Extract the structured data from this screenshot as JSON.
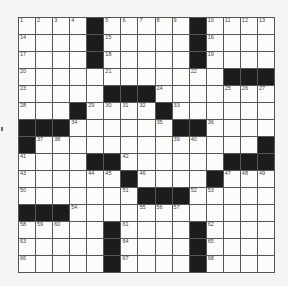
{
  "puzzle": {
    "size": 15,
    "rows": [
      ".... ..... ....",
      ".... ..... ....",
      ".... ..... ....",
      "...........#...",
      ".....###.......",
      "...#....#......",
      "###.....##.....",
      "#.............#",
      "....##......###",
      "......#....#...",
      ".......###.....",
      "###............",
      ".....#....#....",
      ".....#....#....",
      ".....#....#...."
    ],
    "black": [
      [
        0,
        4
      ],
      [
        0,
        10
      ],
      [
        1,
        4
      ],
      [
        1,
        10
      ],
      [
        2,
        4
      ],
      [
        2,
        10
      ],
      [
        3,
        12
      ],
      [
        3,
        13
      ],
      [
        3,
        14
      ],
      [
        4,
        5
      ],
      [
        4,
        6
      ],
      [
        4,
        7
      ],
      [
        5,
        3
      ],
      [
        5,
        8
      ],
      [
        6,
        0
      ],
      [
        6,
        1
      ],
      [
        6,
        2
      ],
      [
        6,
        9
      ],
      [
        6,
        10
      ],
      [
        7,
        0
      ],
      [
        7,
        14
      ],
      [
        8,
        4
      ],
      [
        8,
        5
      ],
      [
        8,
        12
      ],
      [
        8,
        13
      ],
      [
        8,
        14
      ],
      [
        9,
        6
      ],
      [
        9,
        11
      ],
      [
        10,
        7
      ],
      [
        10,
        8
      ],
      [
        10,
        9
      ],
      [
        11,
        0
      ],
      [
        11,
        1
      ],
      [
        11,
        2
      ],
      [
        12,
        5
      ],
      [
        12,
        10
      ],
      [
        13,
        5
      ],
      [
        13,
        10
      ],
      [
        14,
        5
      ],
      [
        14,
        10
      ]
    ],
    "numbers": [
      [
        0,
        0,
        "1"
      ],
      [
        0,
        1,
        "2"
      ],
      [
        0,
        2,
        "3"
      ],
      [
        0,
        3,
        "4"
      ],
      [
        0,
        5,
        "5"
      ],
      [
        0,
        6,
        "6"
      ],
      [
        0,
        7,
        "7"
      ],
      [
        0,
        8,
        "8"
      ],
      [
        0,
        9,
        "9"
      ],
      [
        0,
        11,
        "10"
      ],
      [
        0,
        12,
        "11"
      ],
      [
        0,
        13,
        "12"
      ],
      [
        0,
        14,
        "13"
      ],
      [
        1,
        0,
        "14"
      ],
      [
        1,
        5,
        "15"
      ],
      [
        1,
        11,
        "16"
      ],
      [
        2,
        0,
        "17"
      ],
      [
        2,
        5,
        "18"
      ],
      [
        2,
        11,
        "19"
      ],
      [
        3,
        0,
        "20"
      ],
      [
        3,
        5,
        "21"
      ],
      [
        3,
        10,
        "22"
      ],
      [
        4,
        0,
        "23"
      ],
      [
        4,
        8,
        "24"
      ],
      [
        4,
        12,
        "25"
      ],
      [
        4,
        13,
        "26"
      ],
      [
        4,
        14,
        "27"
      ],
      [
        5,
        0,
        "28"
      ],
      [
        5,
        4,
        "29"
      ],
      [
        5,
        5,
        "30"
      ],
      [
        5,
        6,
        "31"
      ],
      [
        5,
        7,
        "32"
      ],
      [
        5,
        9,
        "33"
      ],
      [
        6,
        3,
        "34"
      ],
      [
        6,
        8,
        "35"
      ],
      [
        6,
        11,
        "36"
      ],
      [
        7,
        1,
        "37"
      ],
      [
        7,
        2,
        "38"
      ],
      [
        7,
        9,
        "39"
      ],
      [
        7,
        10,
        "40"
      ],
      [
        8,
        0,
        "41"
      ],
      [
        8,
        6,
        "42"
      ],
      [
        9,
        0,
        "43"
      ],
      [
        9,
        4,
        "44"
      ],
      [
        9,
        5,
        "45"
      ],
      [
        9,
        7,
        "46"
      ],
      [
        9,
        12,
        "47"
      ],
      [
        9,
        13,
        "48"
      ],
      [
        9,
        14,
        "49"
      ],
      [
        10,
        0,
        "50"
      ],
      [
        10,
        6,
        "51"
      ],
      [
        10,
        10,
        "52"
      ],
      [
        10,
        11,
        "53"
      ],
      [
        11,
        3,
        "54"
      ],
      [
        11,
        7,
        "55"
      ],
      [
        11,
        8,
        "56"
      ],
      [
        11,
        9,
        "57"
      ],
      [
        12,
        0,
        "58"
      ],
      [
        12,
        1,
        "59"
      ],
      [
        12,
        2,
        "60"
      ],
      [
        12,
        6,
        "61"
      ],
      [
        12,
        11,
        "62"
      ],
      [
        13,
        0,
        "63"
      ],
      [
        13,
        6,
        "64"
      ],
      [
        13,
        11,
        "65"
      ],
      [
        14,
        0,
        "66"
      ],
      [
        14,
        6,
        "67"
      ],
      [
        14,
        11,
        "68"
      ]
    ]
  }
}
